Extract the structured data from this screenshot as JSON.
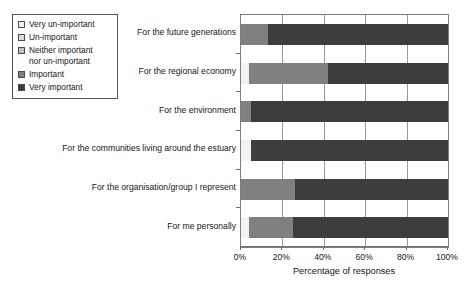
{
  "chart_data": {
    "type": "bar",
    "orientation": "horizontal",
    "stacked": true,
    "normalized_percent": true,
    "title": "",
    "xlabel": "Percentage of responses",
    "ylabel": "",
    "xlim": [
      0,
      100
    ],
    "xticks": [
      "0%",
      "20%",
      "40%",
      "60%",
      "80%",
      "100%"
    ],
    "xtick_values": [
      0,
      20,
      40,
      60,
      80,
      100
    ],
    "grid": "vertical",
    "legend_position": "upper-left-outside",
    "categories": [
      "For the future generations",
      "For the regional economy",
      "For the environment",
      "For the communities living around the estuary",
      "For the organisation/group I represent",
      "For me personally"
    ],
    "series": [
      {
        "name": "Very un-important",
        "color": "#f2f2f2",
        "values": [
          0,
          4,
          0,
          5,
          0,
          4
        ]
      },
      {
        "name": "Un-important",
        "color": "#dcdcdc",
        "values": [
          0,
          0,
          0,
          0,
          0,
          0
        ]
      },
      {
        "name": "Neither important nor un-important",
        "color": "#bfbfbf",
        "values": [
          0,
          0,
          0,
          0,
          0,
          0
        ]
      },
      {
        "name": "Important",
        "color": "#808080",
        "values": [
          13,
          38,
          5,
          0,
          26,
          21
        ]
      },
      {
        "name": "Very important",
        "color": "#3d3d3d",
        "values": [
          87,
          58,
          95,
          95,
          74,
          75
        ]
      }
    ]
  },
  "legend": {
    "items": [
      {
        "label": "Very un-important",
        "color": "#f2f2f2"
      },
      {
        "label": "Un-important",
        "color": "#dcdcdc"
      },
      {
        "label": "Neither important\nnor un-important",
        "color": "#bfbfbf"
      },
      {
        "label": "Important",
        "color": "#808080"
      },
      {
        "label": "Very important",
        "color": "#3d3d3d"
      }
    ]
  }
}
